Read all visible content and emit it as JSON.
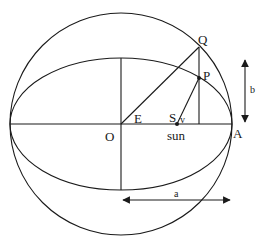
{
  "diagram": {
    "type": "kepler-eccentric-anomaly",
    "labels": {
      "Q": "Q",
      "P": "P",
      "O": "O",
      "E": "E",
      "S": "S",
      "v": "v",
      "sun": "sun",
      "A": "A",
      "a": "a",
      "b": "b"
    },
    "colors": {
      "ink": "#1a1a1a",
      "background": "#ffffff"
    }
  }
}
